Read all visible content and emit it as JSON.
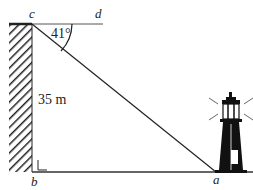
{
  "diagram": {
    "labels": {
      "c": "c",
      "d": "d",
      "b": "b",
      "a": "a",
      "angle": "41°",
      "height": "35 m"
    },
    "colors": {
      "line": "#222222",
      "ground": "#333333"
    },
    "elements": [
      "cliff-wall",
      "horizontal-line-cd",
      "line-of-sight-ca",
      "ground-line-ba",
      "right-angle-marker-b",
      "angle-arc-41",
      "lighthouse"
    ]
  }
}
